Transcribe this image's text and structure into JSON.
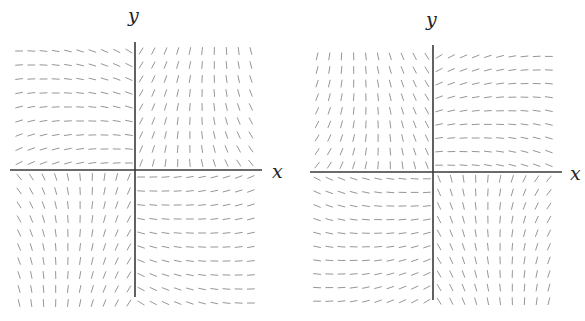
{
  "chart_data": [
    {
      "type": "slope_field",
      "title": "",
      "xlabel": "x",
      "ylabel": "y",
      "grid": "off",
      "legend": "none",
      "panel_offset_x": 0,
      "origin_px": [
        135,
        170
      ],
      "x_axis_px": [
        10,
        262
      ],
      "y_axis_px": [
        42,
        297
      ],
      "cols_left": 10,
      "cols_right": 10,
      "rows_top": 9,
      "rows_bottom": 10,
      "spacing_px": [
        12.2,
        14.0
      ],
      "segment_len_px": 7,
      "segment_color": "#8a8a8a",
      "axis_color": "#3a3a3a",
      "xlabel_pos_px": [
        272,
        162
      ],
      "ylabel_pos_px": [
        128,
        6
      ],
      "quadrant_pattern": {
        "Q1": "steep: '\\' near y-axis, turning '/' toward large x",
        "Q2": "near-horizontal, slight '\\' near y-axis, slight '/' near x-axis",
        "Q3": "steep: '/' at far left, '\\' near y-axis",
        "Q4": "near-horizontal, '\\' near y-axis, slight '/' at large x"
      },
      "mirror_y": false
    },
    {
      "type": "slope_field",
      "title": "",
      "xlabel": "x",
      "ylabel": "y",
      "grid": "off",
      "legend": "none",
      "panel_offset_x": 0,
      "origin_px": [
        433,
        172
      ],
      "x_axis_px": [
        310,
        562
      ],
      "y_axis_px": [
        45,
        300
      ],
      "cols_left": 10,
      "cols_right": 10,
      "rows_top": 9,
      "rows_bottom": 10,
      "spacing_px": [
        12.2,
        13.6
      ],
      "segment_len_px": 7,
      "segment_color": "#8a8a8a",
      "axis_color": "#3a3a3a",
      "xlabel_pos_px": [
        570,
        164
      ],
      "ylabel_pos_px": [
        426,
        10
      ],
      "quadrant_pattern": {
        "Q1": "near-horizontal, '\\' near y-axis, slight '/' near x-axis at large x",
        "Q2": "steep: '\\' near y-axis, '/' toward far left and near x-axis",
        "Q3": "near-horizontal, '/' near x-axis, '\\' near y-axis",
        "Q4": "steep: '\\' near y-axis, '/' toward large x"
      },
      "mirror_y": true
    }
  ]
}
